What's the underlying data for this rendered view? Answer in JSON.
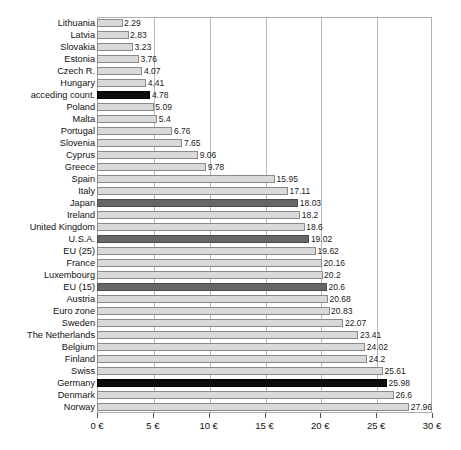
{
  "chart_data": {
    "type": "bar",
    "orientation": "horizontal",
    "title": "",
    "subtitle": "",
    "xlabel": "",
    "ylabel": "",
    "xlim": [
      0,
      30
    ],
    "grid": true,
    "legend": "none",
    "xticks": [
      0,
      5,
      10,
      15,
      20,
      25,
      30
    ],
    "xtick_labels": [
      "0 €",
      "5 €",
      "10 €",
      "15 €",
      "20 €",
      "25 €",
      "30 €"
    ],
    "series_name": "",
    "categories": [
      "Lithuania",
      "Latvia",
      "Slovakia",
      "Estonia",
      "Czech R.",
      "Hungary",
      "acceding count.",
      "Poland",
      "Malta",
      "Portugal",
      "Slovenia",
      "Cyprus",
      "Greece",
      "Spain",
      "Italy",
      "Japan",
      "Ireland",
      "United Kingdom",
      "U.S.A.",
      "EU (25)",
      "France",
      "Luxembourg",
      "EU (15)",
      "Austria",
      "Euro zone",
      "Sweden",
      "The Netherlands",
      "Belgium",
      "Finland",
      "Swiss",
      "Germany",
      "Denmark",
      "Norway"
    ],
    "values": [
      2.29,
      2.83,
      3.23,
      3.76,
      4.07,
      4.41,
      4.78,
      5.09,
      5.4,
      6.76,
      7.65,
      9.06,
      9.78,
      15.95,
      17.11,
      18.03,
      18.2,
      18.6,
      19.02,
      19.62,
      20.16,
      20.2,
      20.6,
      20.68,
      20.83,
      22.07,
      23.41,
      24.02,
      24.2,
      25.61,
      25.98,
      26.6,
      27.96
    ],
    "value_labels": [
      "2.29",
      "2.83",
      "3.23",
      "3.76",
      "4.07",
      "4.41",
      "4.78",
      "5.09",
      "5.4",
      "6.76",
      "7.65",
      "9.06",
      "9.78",
      "15.95",
      "17.11",
      "18.03",
      "18.2",
      "18.6",
      "19.02",
      "19.62",
      "20.16",
      "20.2",
      "20.6",
      "20.68",
      "20.83",
      "22.07",
      "23.41",
      "24.02",
      "24.2",
      "25.61",
      "25.98",
      "26.6",
      "27.96"
    ],
    "bar_styles": [
      "light",
      "light",
      "light",
      "light",
      "light",
      "light",
      "black",
      "light",
      "light",
      "light",
      "light",
      "light",
      "light",
      "light",
      "light",
      "dark",
      "light",
      "light",
      "dark",
      "light",
      "light",
      "light",
      "dark",
      "light",
      "light",
      "light",
      "light",
      "light",
      "light",
      "light",
      "black",
      "light",
      "light"
    ],
    "colors": {
      "light_bar": "#d9d9d9",
      "dark_bar": "#676767",
      "black_bar": "#0d0d0d",
      "bar_border": "#8a8a8a",
      "gridline": "#b8b8b8",
      "axis": "#b0b0b0",
      "text": "#111111",
      "background": "#ffffff"
    }
  }
}
